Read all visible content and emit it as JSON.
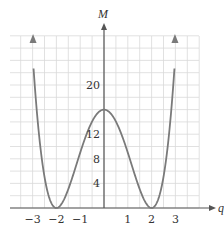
{
  "chart_data": {
    "type": "line",
    "title": "",
    "xlabel": "q",
    "ylabel": "M",
    "function": "M = (q^2 - 4)^2",
    "x_ticks": [
      -3,
      -2,
      -1,
      1,
      2,
      3
    ],
    "x_tick_labels": [
      "−3",
      "−2",
      "−1",
      "1",
      "2",
      "3"
    ],
    "y_ticks": [
      4,
      8,
      12,
      20
    ],
    "y_tick_labels": [
      "4",
      "8",
      "12",
      "20"
    ],
    "xlim": [
      -4.0,
      4.0
    ],
    "ylim": [
      0,
      28
    ],
    "grid": true,
    "grid_step_x": 0.5,
    "grid_step_y": 2,
    "series": [
      {
        "name": "M(q)",
        "x": [
          -2.96,
          -2.75,
          -2.5,
          -2.25,
          -2.0,
          -1.75,
          -1.5,
          -1.25,
          -1.0,
          -0.75,
          -0.5,
          -0.25,
          0.0,
          0.25,
          0.5,
          0.75,
          1.0,
          1.25,
          1.5,
          1.75,
          2.0,
          2.25,
          2.5,
          2.75,
          2.96
        ],
        "values": [
          23.8,
          12.7,
          5.1,
          1.1,
          0.0,
          0.9,
          3.1,
          5.9,
          9.0,
          11.8,
          14.1,
          15.5,
          16.0,
          15.5,
          14.1,
          11.8,
          9.0,
          5.9,
          3.1,
          0.9,
          0.0,
          1.1,
          5.1,
          12.7,
          23.8
        ],
        "color": "#7a7a7a",
        "arrows_at_ends": true
      }
    ],
    "key_points": [
      {
        "q": -2,
        "M": 0,
        "label": "minimum"
      },
      {
        "q": 0,
        "M": 16,
        "label": "local maximum"
      },
      {
        "q": 2,
        "M": 0,
        "label": "minimum"
      }
    ]
  },
  "colors": {
    "grid": "#d9d9d9",
    "axis": "#555555",
    "curve": "#7a7a7a",
    "text": "#333333"
  }
}
